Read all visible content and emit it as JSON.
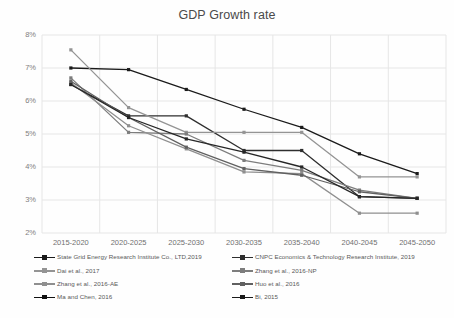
{
  "chart_data": {
    "type": "line",
    "title": "GDP Growth rate",
    "xlabel": "",
    "ylabel": "",
    "grid": true,
    "legend_position": "bottom",
    "ylim": [
      2,
      8
    ],
    "yticks": [
      "2%",
      "3%",
      "4%",
      "5%",
      "6%",
      "7%",
      "8%"
    ],
    "ytick_values": [
      2,
      3,
      4,
      5,
      6,
      7,
      8
    ],
    "categories": [
      "2015-2020",
      "2020-2025",
      "2025-2030",
      "2030-2035",
      "2035-2040",
      "2040-2045",
      "2045-2050"
    ],
    "series": [
      {
        "name": "State Grid Energy Research Institute Co., LTD,2019",
        "color": "#1a1a1a",
        "values": [
          7.0,
          6.95,
          6.35,
          5.75,
          5.2,
          4.4,
          3.8
        ]
      },
      {
        "name": "CNPC Economics & Technology Research Institute, 2019",
        "color": "#2e2e2e",
        "values": [
          6.5,
          5.55,
          5.55,
          4.5,
          4.5,
          3.1,
          3.05
        ]
      },
      {
        "name": "Dai et al., 2017",
        "color": "#949494",
        "values": [
          7.55,
          5.8,
          5.05,
          5.05,
          5.05,
          3.7,
          3.7
        ]
      },
      {
        "name": "Zhang et al., 2016-NP",
        "color": "#7d7d7d",
        "values": [
          6.7,
          5.05,
          5.0,
          4.2,
          3.9,
          3.3,
          3.05
        ]
      },
      {
        "name": "Zhang et al., 2016-AE",
        "color": "#8f8f8f",
        "values": [
          6.55,
          5.25,
          4.55,
          3.85,
          3.8,
          2.6,
          2.6
        ]
      },
      {
        "name": "Huo et al., 2016",
        "color": "#606060",
        "values": [
          6.6,
          5.5,
          4.6,
          3.95,
          3.75,
          3.25,
          3.05
        ]
      },
      {
        "name": "Bi, 2015",
        "color": "#262626",
        "values": [
          6.5,
          5.5,
          4.85,
          4.45,
          4.0,
          3.1,
          3.05
        ]
      }
    ]
  },
  "legend": {
    "left_items": [
      "State Grid Energy Research Institute Co., LTD,2019",
      "Dai et al., 2017",
      "Zhang et al., 2016-AE",
      "Ma and Chen, 2016"
    ],
    "right_items": [
      "CNPC Economics & Technology Research Institute, 2019",
      "Zhang et al., 2016-NP",
      "Huo et al., 2016",
      "Bi, 2015"
    ],
    "left_colors": [
      "#1a1a1a",
      "#949494",
      "#8f8f8f",
      "#111111"
    ],
    "right_colors": [
      "#2e2e2e",
      "#7d7d7d",
      "#606060",
      "#1a1a1a"
    ]
  }
}
